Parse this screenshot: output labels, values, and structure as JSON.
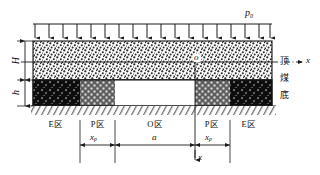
{
  "figure": {
    "load_label": "p",
    "load_label_sub": "0",
    "origin_label": "o",
    "axis_label": "x",
    "axis_label_bottom": "x",
    "dimensions": {
      "height_upper": "H",
      "height_lower": "h",
      "plastic_left": "x",
      "plastic_left_sub": "p",
      "opening": "a",
      "plastic_right": "x",
      "plastic_right_sub": "p"
    },
    "zones": [
      {
        "label": "E区",
        "name": "elastic-zone-left"
      },
      {
        "label": "P区",
        "name": "plastic-zone-left"
      },
      {
        "label": "O区",
        "name": "opening-zone"
      },
      {
        "label": "P区",
        "name": "plastic-zone-right"
      },
      {
        "label": "E区",
        "name": "elastic-zone-right"
      }
    ],
    "strata_labels": {
      "roof": "顶",
      "coal": "煤",
      "floor": "底"
    },
    "arrow_count": 18,
    "colors": {
      "line": "#1a1a1a",
      "roof_fill": "#ffffff",
      "elastic_fill": "#111111",
      "plastic_fill": "#6e6e6e",
      "opening_fill": "#ffffff"
    }
  }
}
